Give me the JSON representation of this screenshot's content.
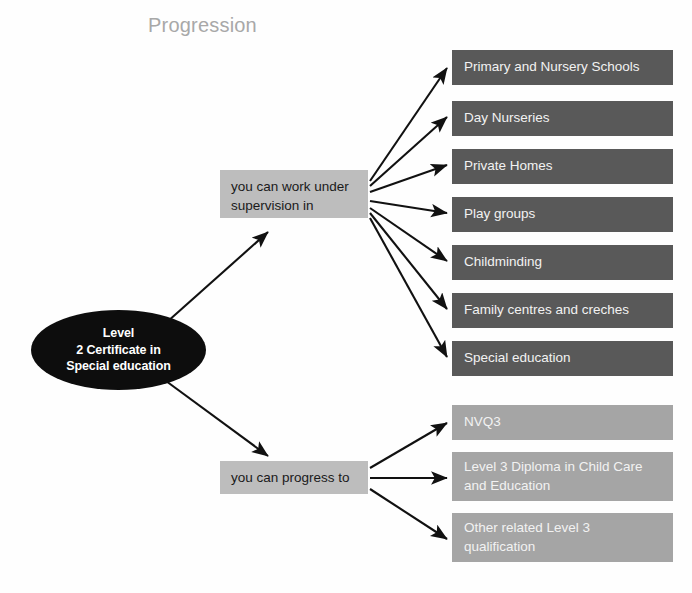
{
  "title": "Progression",
  "colors": {
    "background": "#fefefe",
    "title_text": "#a8a8a8",
    "root_fill": "#0d0d0d",
    "root_text": "#ffffff",
    "mid_box_fill": "#bdbdbd",
    "mid_box_text": "#1a1a1a",
    "work_box_fill": "#595959",
    "progress_box_fill": "#a5a5a5",
    "out_box_text": "#f2f2f2",
    "arrow": "#111111"
  },
  "root": {
    "lines": [
      "Level",
      "2 Certificate in",
      "Special education"
    ],
    "full_text": "Level 2 Certificate in Special education"
  },
  "branches": [
    {
      "id": "work-under-supervision",
      "label": "you can work under supervision in",
      "label_lines": [
        "you can work under",
        "supervision in"
      ],
      "style": "dark",
      "targets": [
        {
          "label": "Primary and Nursery Schools",
          "lines": [
            "Primary and Nursery Schools"
          ]
        },
        {
          "label": "Day Nurseries",
          "lines": [
            "Day Nurseries"
          ]
        },
        {
          "label": "Private Homes",
          "lines": [
            "Private Homes"
          ]
        },
        {
          "label": "Play groups",
          "lines": [
            "Play groups"
          ]
        },
        {
          "label": "Childminding",
          "lines": [
            "Childminding"
          ]
        },
        {
          "label": "Family centres and creches",
          "lines": [
            "Family centres and creches"
          ]
        },
        {
          "label": "Special education",
          "lines": [
            "Special education"
          ]
        }
      ]
    },
    {
      "id": "progress-to",
      "label": "you can progress to",
      "label_lines": [
        "you can progress to"
      ],
      "style": "light",
      "targets": [
        {
          "label": "NVQ3",
          "lines": [
            "NVQ3"
          ]
        },
        {
          "label": "Level 3 Diploma in Child Care and Education",
          "lines": [
            "Level 3 Diploma in Child Care",
            "and Education"
          ]
        },
        {
          "label": "Other related Level 3 qualification",
          "lines": [
            "Other related Level 3",
            "qualification"
          ]
        }
      ]
    }
  ],
  "layout": {
    "work_boxes": [
      {
        "top": 50,
        "height": 35
      },
      {
        "top": 101,
        "height": 35
      },
      {
        "top": 149,
        "height": 35
      },
      {
        "top": 197,
        "height": 35
      },
      {
        "top": 245,
        "height": 35
      },
      {
        "top": 293,
        "height": 35
      },
      {
        "top": 341,
        "height": 35
      }
    ],
    "progress_boxes": [
      {
        "top": 405,
        "height": 35
      },
      {
        "top": 452,
        "height": 49
      },
      {
        "top": 513,
        "height": 49
      }
    ]
  }
}
